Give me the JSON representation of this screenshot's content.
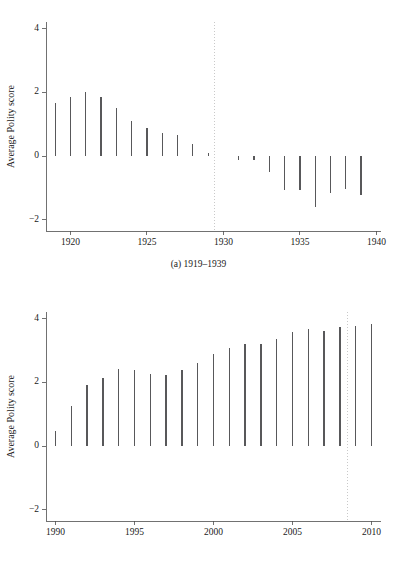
{
  "figure": {
    "panels": [
      {
        "id": "a",
        "caption": "(a) 1919–1939",
        "ylabel": "Average Polity score"
      },
      {
        "id": "b",
        "caption": "(b) 1990–2010",
        "ylabel": "Average Polity score"
      }
    ],
    "colors": {
      "bar": "#58585a",
      "axis": "#4d4d4d",
      "reference_line": "#c9c9c9",
      "background": "#ffffff"
    }
  },
  "chart_data": [
    {
      "type": "bar",
      "title": "(a) 1919–1939",
      "xlabel": "",
      "ylabel": "Average Polity score",
      "xlim": [
        1918.4,
        1940.3
      ],
      "ylim": [
        -2.35,
        4.2
      ],
      "yticks": [
        -2,
        0,
        2,
        4
      ],
      "ytick_labels": [
        "−2",
        "0",
        "2",
        "4"
      ],
      "xticks": [
        1920,
        1925,
        1930,
        1935,
        1940
      ],
      "xtick_labels": [
        "1920",
        "1925",
        "1930",
        "1935",
        "1940"
      ],
      "grid": false,
      "legend": null,
      "baseline": 0,
      "reference_lines": [
        {
          "orientation": "vertical",
          "x": 1929.4,
          "style": "dotted"
        }
      ],
      "categories": [
        1919,
        1920,
        1921,
        1922,
        1923,
        1924,
        1925,
        1926,
        1927,
        1928,
        1929,
        1931,
        1932,
        1933,
        1934,
        1935,
        1936,
        1937,
        1938,
        1939
      ],
      "values": [
        1.66,
        1.85,
        2.0,
        1.84,
        1.5,
        1.1,
        0.89,
        0.73,
        0.66,
        0.37,
        0.08,
        -0.13,
        -0.12,
        -0.5,
        -1.05,
        -1.07,
        -1.6,
        -1.15,
        -1.04,
        -1.22
      ]
    },
    {
      "type": "bar",
      "title": "(b) 1990–2010",
      "xlabel": "",
      "ylabel": "Average Polity score",
      "xlim": [
        1989.4,
        2010.6
      ],
      "ylim": [
        -2.35,
        4.2
      ],
      "yticks": [
        -2,
        0,
        2,
        4
      ],
      "ytick_labels": [
        "−2",
        "0",
        "2",
        "4"
      ],
      "xticks": [
        1990,
        1995,
        2000,
        2005,
        2010
      ],
      "xtick_labels": [
        "1990",
        "1995",
        "2000",
        "2005",
        "2010"
      ],
      "grid": false,
      "legend": null,
      "baseline": 0,
      "reference_lines": [
        {
          "orientation": "vertical",
          "x": 2008.5,
          "style": "dotted"
        }
      ],
      "categories": [
        1990,
        1991,
        1992,
        1993,
        1994,
        1995,
        1996,
        1997,
        1998,
        1999,
        2000,
        2001,
        2002,
        2003,
        2004,
        2005,
        2006,
        2007,
        2008,
        2009,
        2010
      ],
      "values": [
        0.48,
        1.26,
        1.92,
        2.12,
        2.4,
        2.38,
        2.26,
        2.24,
        2.39,
        2.61,
        2.89,
        3.07,
        3.2,
        3.19,
        3.34,
        3.57,
        3.67,
        3.62,
        3.74,
        3.76,
        3.82
      ]
    }
  ]
}
